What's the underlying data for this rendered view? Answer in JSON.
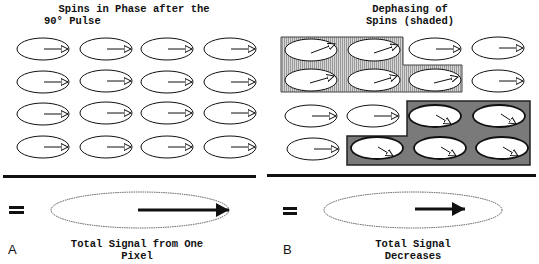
{
  "panel_a": {
    "title_line1": "Spins in Phase after the",
    "title_line2": "90° Pulse",
    "label": "A",
    "equals": "=",
    "caption_line1": "Total Signal from One",
    "caption_line2": "Pixel",
    "grid": {
      "rows": 4,
      "cols": 4,
      "state": "in-phase"
    }
  },
  "panel_b": {
    "title_line1": "Dephasing of",
    "title_line2": "Spins (shaded)",
    "label": "B",
    "equals": "=",
    "caption_line1": "Total Signal",
    "caption_line2": "Decreases",
    "grid": {
      "rows": 4,
      "cols": 4,
      "state": "partially-dephased"
    },
    "shaded_regions": [
      {
        "name": "light-hatched",
        "color": "#c4c4c4",
        "spins": "row1 col1-2, row2 col1-3",
        "arrow_direction": "up-right"
      },
      {
        "name": "dark",
        "color": "#7a7a7a",
        "spins": "row3 col3-4, row4 col2-4",
        "arrow_direction": "down-right"
      }
    ]
  },
  "colors": {
    "ink": "#111111",
    "background": "#ffffff",
    "light_shade": "#c4c4c4",
    "dark_shade": "#7a7a7a"
  }
}
